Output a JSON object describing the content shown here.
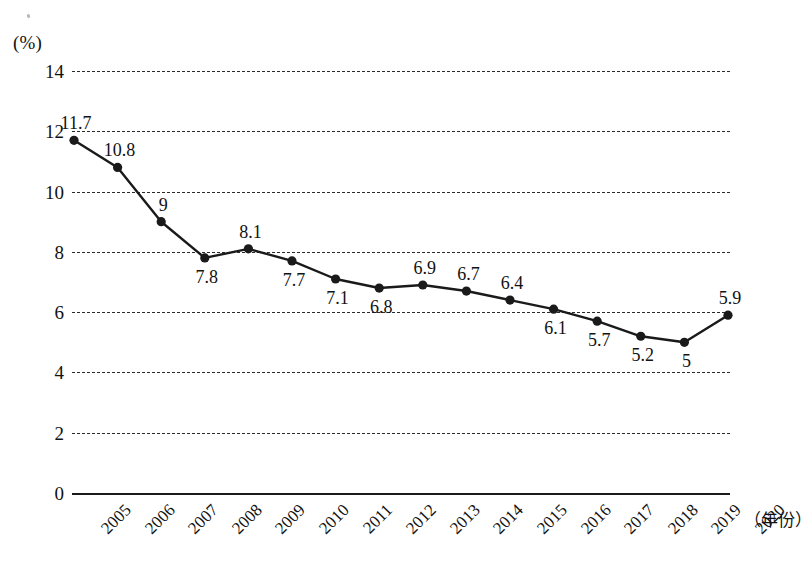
{
  "chart_data": {
    "type": "line",
    "title": "",
    "xlabel": "（年份）",
    "ylabel": "(%)",
    "ylim": [
      0,
      14
    ],
    "yticks": [
      0,
      2,
      4,
      6,
      8,
      10,
      12,
      14
    ],
    "ytick_labels": [
      "0",
      "2",
      "4",
      "6",
      "8",
      "10",
      "12",
      "14"
    ],
    "grid": true,
    "legend": false,
    "categories": [
      "2005",
      "2006",
      "2007",
      "2008",
      "2009",
      "2010",
      "2011",
      "2012",
      "2013",
      "2014",
      "2015",
      "2016",
      "2017",
      "2018",
      "2019",
      "2020"
    ],
    "values": [
      11.7,
      10.8,
      9,
      7.8,
      8.1,
      7.7,
      7.1,
      6.8,
      6.9,
      6.7,
      6.4,
      6.1,
      5.7,
      5.2,
      5,
      5.9
    ],
    "point_labels": [
      "11.7",
      "10.8",
      "9",
      "7.8",
      "8.1",
      "7.7",
      "7.1",
      "6.8",
      "6.9",
      "6.7",
      "6.4",
      "6.1",
      "5.7",
      "5.2",
      "5",
      "5.9"
    ],
    "label_positions": [
      "above",
      "above",
      "above",
      "below",
      "above",
      "below",
      "below",
      "below",
      "above",
      "above",
      "above",
      "below",
      "below",
      "below",
      "below",
      "above"
    ],
    "marker": "filled-circle",
    "line_color": "#1a1a1a",
    "marker_color": "#1a1a1a",
    "gridline_color": "#2a2a2a",
    "gridline_style": "dashed",
    "axis_color": "#1a1a1a"
  }
}
